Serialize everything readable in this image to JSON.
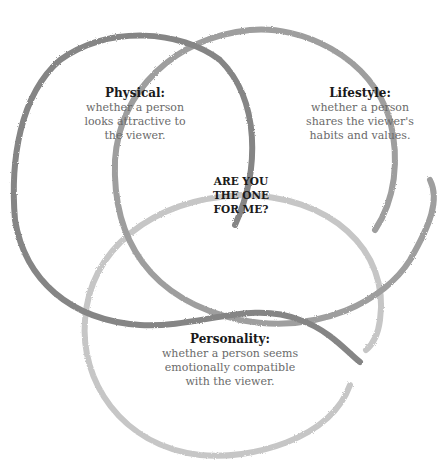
{
  "diagram": {
    "type": "venn",
    "center_lines": [
      "ARE YOU",
      "THE ONE",
      "FOR ME?"
    ],
    "sets": [
      {
        "id": "physical",
        "title": "Physical:",
        "lines": [
          "whether a person",
          "looks attractive to",
          "the viewer."
        ],
        "color": "#858585"
      },
      {
        "id": "lifestyle",
        "title": "Lifestyle:",
        "lines": [
          "whether a person",
          "shares the viewer's",
          "habits and values."
        ],
        "color": "#9e9e9e"
      },
      {
        "id": "personality",
        "title": "Personality:",
        "lines": [
          "whether a person seems",
          "emotionally compatible",
          "with the viewer."
        ],
        "color": "#c6c6c6"
      }
    ]
  }
}
